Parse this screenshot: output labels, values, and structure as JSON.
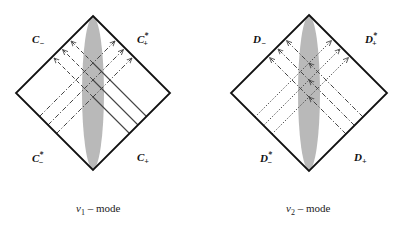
{
  "panels": [
    {
      "id": "left",
      "cx": 93,
      "cy": 93,
      "h": 77,
      "mode": "v1",
      "caption": {
        "var": "v",
        "sub": "1",
        "text": " – mode"
      },
      "labels": {
        "top_left": {
          "base": "C",
          "sub": "−",
          "sup": ""
        },
        "top_right": {
          "base": "C",
          "sub": "+",
          "sup": "*"
        },
        "bottom_left": {
          "base": "C",
          "sub": "−",
          "sup": "*"
        },
        "bottom_right": {
          "base": "C",
          "sub": "+",
          "sup": ""
        }
      },
      "nw_lines_style": "solid-then-dashed",
      "ne_lines_style": "dash-dot",
      "crossings": [
        -30,
        -13,
        4
      ]
    },
    {
      "id": "right",
      "cx": 309,
      "cy": 93,
      "h": 78,
      "mode": "v2",
      "caption": {
        "var": "v",
        "sub": "2",
        "text": " – mode"
      },
      "labels": {
        "top_left": {
          "base": "D",
          "sub": "−",
          "sup": ""
        },
        "top_right": {
          "base": "D",
          "sub": "+",
          "sup": "*"
        },
        "bottom_left": {
          "base": "D",
          "sub": "−",
          "sup": "*"
        },
        "bottom_right": {
          "base": "D",
          "sub": "+",
          "sup": ""
        }
      },
      "nw_lines_style": "dash-dot",
      "ne_lines_style": "dotted",
      "crossings": [
        -30,
        -13,
        4
      ]
    }
  ],
  "colors": {
    "frame": "#111111",
    "ellipse": "#b9b9b9",
    "lines": "#444444"
  }
}
